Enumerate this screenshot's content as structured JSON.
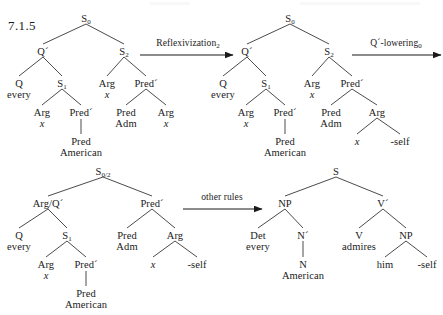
{
  "figure": {
    "section_number": "7.1.5"
  },
  "arrows": [
    {
      "id": "arrow-reflexivization",
      "label_text": "Reflexivization",
      "label_sub": "2",
      "x1": 140,
      "y1": 55,
      "x2": 233,
      "y2": 55,
      "label_cx": 188,
      "label_y": 38
    },
    {
      "id": "arrow-q-lowering",
      "label_text": "Q´-lowering",
      "label_sub": "0",
      "x1": 352,
      "y1": 55,
      "x2": 441,
      "y2": 55,
      "label_cx": 396,
      "label_y": 38
    },
    {
      "id": "arrow-other-rules",
      "label_text": "other rules",
      "label_sub": "",
      "x1": 183,
      "y1": 209,
      "x2": 262,
      "y2": 209,
      "label_cx": 222,
      "label_y": 192
    }
  ],
  "trees": [
    {
      "id": "tree-deep-structure",
      "name": "Deep structure",
      "nodes": [
        {
          "id": "t1-s0",
          "label": "S",
          "sub": "0",
          "x": 86,
          "y": 14
        },
        {
          "id": "t1-qbar",
          "label": "Q´",
          "sub": "",
          "x": 43,
          "y": 47
        },
        {
          "id": "t1-s2",
          "label": "S",
          "sub": "2",
          "x": 124,
          "y": 47
        },
        {
          "id": "t1-q",
          "label": "Q",
          "sub": "",
          "x": 19,
          "y": 79,
          "line2": "every"
        },
        {
          "id": "t1-s1",
          "label": "S",
          "sub": "1",
          "x": 62,
          "y": 79
        },
        {
          "id": "t1-arg-a",
          "label": "Arg",
          "sub": "",
          "x": 107,
          "y": 79,
          "line2": "x",
          "line2_italic": true
        },
        {
          "id": "t1-predbar",
          "label": "Pred´",
          "sub": "",
          "x": 146,
          "y": 79
        },
        {
          "id": "t1-arg-b",
          "label": "Arg",
          "sub": "",
          "x": 42,
          "y": 108,
          "line2": "x",
          "line2_italic": true
        },
        {
          "id": "t1-predbar2",
          "label": "Pred´",
          "sub": "",
          "x": 81,
          "y": 108
        },
        {
          "id": "t1-pred-adm",
          "label": "Pred",
          "sub": "",
          "x": 126,
          "y": 108,
          "line2": "Adm"
        },
        {
          "id": "t1-arg-c",
          "label": "Arg",
          "sub": "",
          "x": 166,
          "y": 108,
          "line2": "x",
          "line2_italic": true
        },
        {
          "id": "t1-pred-am",
          "label": "Pred",
          "sub": "",
          "x": 81,
          "y": 137,
          "line2": "American"
        }
      ],
      "edges": [
        [
          86,
          24,
          43,
          44
        ],
        [
          86,
          24,
          124,
          44
        ],
        [
          43,
          57,
          19,
          76
        ],
        [
          43,
          57,
          62,
          76
        ],
        [
          124,
          57,
          107,
          76
        ],
        [
          124,
          57,
          146,
          76
        ],
        [
          62,
          89,
          42,
          105
        ],
        [
          62,
          89,
          81,
          105
        ],
        [
          146,
          89,
          126,
          105
        ],
        [
          146,
          89,
          166,
          105
        ],
        [
          81,
          119,
          81,
          134
        ]
      ]
    },
    {
      "id": "tree-after-reflexivization",
      "name": "After Reflexivization",
      "nodes": [
        {
          "id": "t2-s0",
          "label": "S",
          "sub": "0",
          "x": 290,
          "y": 14
        },
        {
          "id": "t2-qbar",
          "label": "Q´",
          "sub": "",
          "x": 247,
          "y": 47
        },
        {
          "id": "t2-s2",
          "label": "S",
          "sub": "2",
          "x": 329,
          "y": 47
        },
        {
          "id": "t2-q",
          "label": "Q",
          "sub": "",
          "x": 223,
          "y": 79,
          "line2": "every"
        },
        {
          "id": "t2-s1",
          "label": "S",
          "sub": "1",
          "x": 266,
          "y": 79
        },
        {
          "id": "t2-arg-a",
          "label": "Arg",
          "sub": "",
          "x": 312,
          "y": 79,
          "line2": "x",
          "line2_italic": true
        },
        {
          "id": "t2-predbar",
          "label": "Pred´",
          "sub": "",
          "x": 352,
          "y": 79
        },
        {
          "id": "t2-arg-b",
          "label": "Arg",
          "sub": "",
          "x": 246,
          "y": 108,
          "line2": "x",
          "line2_italic": true
        },
        {
          "id": "t2-predbar2",
          "label": "Pred´",
          "sub": "",
          "x": 285,
          "y": 108
        },
        {
          "id": "t2-pred-adm",
          "label": "Pred",
          "sub": "",
          "x": 331,
          "y": 108,
          "line2": "Adm"
        },
        {
          "id": "t2-arg-c",
          "label": "Arg",
          "sub": "",
          "x": 377,
          "y": 108
        },
        {
          "id": "t2-pred-am",
          "label": "Pred",
          "sub": "",
          "x": 285,
          "y": 137,
          "line2": "American"
        },
        {
          "id": "t2-x",
          "label": "x",
          "sub": "",
          "x": 357,
          "y": 137,
          "italic": true
        },
        {
          "id": "t2-self",
          "label": "-self",
          "sub": "",
          "x": 400,
          "y": 137
        }
      ],
      "edges": [
        [
          290,
          24,
          247,
          44
        ],
        [
          290,
          24,
          329,
          44
        ],
        [
          247,
          57,
          223,
          76
        ],
        [
          247,
          57,
          266,
          76
        ],
        [
          329,
          57,
          312,
          76
        ],
        [
          329,
          57,
          352,
          76
        ],
        [
          266,
          89,
          246,
          105
        ],
        [
          266,
          89,
          285,
          105
        ],
        [
          352,
          89,
          331,
          105
        ],
        [
          352,
          89,
          377,
          105
        ],
        [
          285,
          119,
          285,
          134
        ],
        [
          377,
          118,
          357,
          134
        ],
        [
          377,
          118,
          400,
          134
        ]
      ]
    },
    {
      "id": "tree-after-q-lowering",
      "name": "After Q-bar lowering",
      "nodes": [
        {
          "id": "t3-s02",
          "label": "S",
          "sub": "0/2",
          "x": 103,
          "y": 167
        },
        {
          "id": "t3-argq",
          "label": "Arg/Q´",
          "sub": "",
          "x": 48,
          "y": 199
        },
        {
          "id": "t3-predbar",
          "label": "Pred´",
          "sub": "",
          "x": 152,
          "y": 199
        },
        {
          "id": "t3-q",
          "label": "Q",
          "sub": "",
          "x": 19,
          "y": 231,
          "line2": "every"
        },
        {
          "id": "t3-s1",
          "label": "S",
          "sub": "1",
          "x": 67,
          "y": 231
        },
        {
          "id": "t3-pred-adm",
          "label": "Pred",
          "sub": "",
          "x": 127,
          "y": 231,
          "line2": "Adm"
        },
        {
          "id": "t3-arg",
          "label": "Arg",
          "sub": "",
          "x": 175,
          "y": 231
        },
        {
          "id": "t3-arg-b",
          "label": "Arg",
          "sub": "",
          "x": 46,
          "y": 260,
          "line2": "x",
          "line2_italic": true
        },
        {
          "id": "t3-predbar2",
          "label": "Pred´",
          "sub": "",
          "x": 86,
          "y": 260
        },
        {
          "id": "t3-x",
          "label": "x",
          "sub": "",
          "x": 153,
          "y": 260,
          "italic": true
        },
        {
          "id": "t3-self",
          "label": "-self",
          "sub": "",
          "x": 197,
          "y": 260
        },
        {
          "id": "t3-pred-am",
          "label": "Pred",
          "sub": "",
          "x": 86,
          "y": 289,
          "line2": "American"
        }
      ],
      "edges": [
        [
          103,
          177,
          48,
          196
        ],
        [
          103,
          177,
          152,
          196
        ],
        [
          48,
          209,
          19,
          228
        ],
        [
          48,
          209,
          67,
          228
        ],
        [
          152,
          209,
          127,
          228
        ],
        [
          152,
          209,
          175,
          228
        ],
        [
          67,
          241,
          46,
          257
        ],
        [
          67,
          241,
          86,
          257
        ],
        [
          175,
          241,
          153,
          257
        ],
        [
          175,
          241,
          197,
          257
        ],
        [
          86,
          271,
          86,
          286
        ]
      ]
    },
    {
      "id": "tree-surface-structure",
      "name": "Surface structure",
      "nodes": [
        {
          "id": "t4-s",
          "label": "S",
          "sub": "",
          "x": 336,
          "y": 167
        },
        {
          "id": "t4-np",
          "label": "NP",
          "sub": "",
          "x": 285,
          "y": 199
        },
        {
          "id": "t4-vbar",
          "label": "V´",
          "sub": "",
          "x": 383,
          "y": 199
        },
        {
          "id": "t4-det",
          "label": "Det",
          "sub": "",
          "x": 258,
          "y": 231,
          "line2": "every"
        },
        {
          "id": "t4-nbar",
          "label": "N´",
          "sub": "",
          "x": 303,
          "y": 231
        },
        {
          "id": "t4-v",
          "label": "V",
          "sub": "",
          "x": 359,
          "y": 231,
          "line2": "admires"
        },
        {
          "id": "t4-np2",
          "label": "NP",
          "sub": "",
          "x": 406,
          "y": 231
        },
        {
          "id": "t4-n",
          "label": "N",
          "sub": "",
          "x": 303,
          "y": 260,
          "line2": "American"
        },
        {
          "id": "t4-him",
          "label": "him",
          "sub": "",
          "x": 385,
          "y": 260
        },
        {
          "id": "t4-self",
          "label": "-self",
          "sub": "",
          "x": 427,
          "y": 260
        }
      ],
      "edges": [
        [
          336,
          177,
          285,
          196
        ],
        [
          336,
          177,
          383,
          196
        ],
        [
          285,
          209,
          258,
          228
        ],
        [
          285,
          209,
          303,
          228
        ],
        [
          383,
          209,
          359,
          228
        ],
        [
          383,
          209,
          406,
          228
        ],
        [
          303,
          241,
          303,
          257
        ],
        [
          406,
          241,
          385,
          257
        ],
        [
          406,
          241,
          427,
          257
        ]
      ]
    }
  ]
}
